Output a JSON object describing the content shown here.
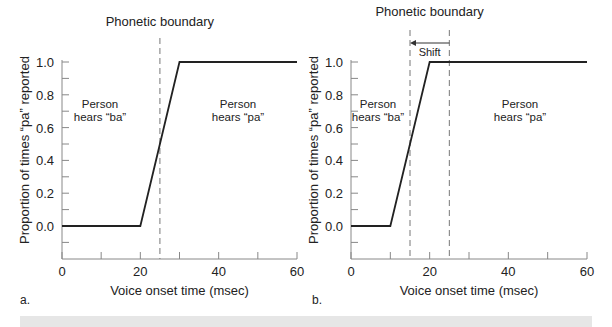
{
  "chart_data": [
    {
      "type": "line",
      "panel_label": "a.",
      "title": "Phonetic boundary",
      "xlabel": "Voice onset time (msec)",
      "ylabel": "Proportion of times “pa” reported",
      "xlim": [
        0,
        60
      ],
      "ylim": [
        -0.2,
        1.0
      ],
      "xticks": [
        0,
        20,
        40,
        60
      ],
      "xminor": [
        10,
        30,
        50
      ],
      "yticks": [
        "0.0",
        "0.2",
        "0.4",
        "0.6",
        "0.8",
        "1.0"
      ],
      "series": [
        {
          "name": "identification",
          "x": [
            0,
            20,
            30,
            60
          ],
          "y": [
            0.0,
            0.0,
            1.0,
            1.0
          ]
        }
      ],
      "boundaries": [
        25
      ],
      "annotations": [
        {
          "text": "Person\nhears “ba”",
          "line1": "Person",
          "line2": "hears “ba”"
        },
        {
          "text": "Person\nhears “pa”",
          "line1": "Person",
          "line2": "hears “pa”"
        }
      ],
      "grid": false
    },
    {
      "type": "line",
      "panel_label": "b.",
      "title": "Phonetic boundary",
      "xlabel": "Voice onset time (msec)",
      "ylabel": "Proportion of times “pa” reported",
      "xlim": [
        0,
        60
      ],
      "ylim": [
        -0.2,
        1.0
      ],
      "xticks": [
        0,
        20,
        40,
        60
      ],
      "xminor": [
        10,
        30,
        50
      ],
      "yticks": [
        "0.0",
        "0.2",
        "0.4",
        "0.6",
        "0.8",
        "1.0"
      ],
      "series": [
        {
          "name": "identification",
          "x": [
            0,
            10,
            20,
            60
          ],
          "y": [
            0.0,
            0.0,
            1.0,
            1.0
          ]
        }
      ],
      "boundaries": [
        15,
        25
      ],
      "shift": {
        "label": "Shift",
        "from": 25,
        "to": 15
      },
      "annotations": [
        {
          "line1": "Person",
          "line2": "hears “ba”"
        },
        {
          "line1": "Person",
          "line2": "hears “pa”"
        }
      ],
      "grid": false
    }
  ]
}
